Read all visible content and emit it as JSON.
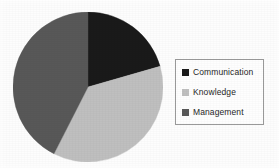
{
  "chart_data": {
    "type": "pie",
    "title": "",
    "subtitle": "",
    "xlabel": "",
    "ylabel": "",
    "grid": false,
    "legend_position": "right",
    "categories": [
      "Communication",
      "Knowledge",
      "Management"
    ],
    "values": [
      20.5,
      37.0,
      42.5
    ],
    "value_unit": "percent",
    "start_angle_deg": 0,
    "direction": "clockwise",
    "slices": [
      {
        "label": "Communication",
        "value": 20.5,
        "color": "#1a1a1a",
        "start_angle_deg": 0,
        "end_angle_deg": 74
      },
      {
        "label": "Knowledge",
        "value": 37.0,
        "color": "#bfbfbf",
        "start_angle_deg": 74,
        "end_angle_deg": 207
      },
      {
        "label": "Management",
        "value": 42.5,
        "color": "#585858",
        "start_angle_deg": 207,
        "end_angle_deg": 360
      }
    ]
  },
  "legend": {
    "entries": [
      {
        "label": "Communication",
        "color": "#1a1a1a",
        "swatch_icon": "square-swatch-icon"
      },
      {
        "label": "Knowledge",
        "color": "#bfbfbf",
        "swatch_icon": "square-swatch-icon"
      },
      {
        "label": "Management",
        "color": "#585858",
        "swatch_icon": "square-swatch-icon"
      }
    ],
    "border_color": "#9a9a9a"
  },
  "canvas": {
    "background": "#fdfdfd",
    "width": 279,
    "height": 168
  }
}
